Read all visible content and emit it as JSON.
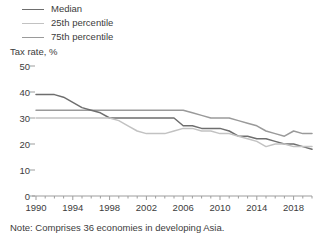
{
  "axis_title": "Tax rate, %",
  "note": "Note: Comprises 36 economies in developing Asia.",
  "legend": {
    "items": [
      {
        "label": "Median",
        "color": "#6e6e6e"
      },
      {
        "label": "25th percentile",
        "color": "#c2c2c2"
      },
      {
        "label": "75th percentile",
        "color": "#9a9a9a"
      }
    ]
  },
  "chart_data": {
    "type": "line",
    "title": "",
    "subtitle": "",
    "xlabel": "",
    "ylabel": "Tax rate, %",
    "xlim": [
      1990,
      2020
    ],
    "ylim": [
      0,
      50
    ],
    "yticks": [
      0,
      10,
      20,
      30,
      40,
      50
    ],
    "xticks": [
      1990,
      1994,
      1998,
      2002,
      2006,
      2010,
      2014,
      2018
    ],
    "grid": false,
    "legend_position": "top-left",
    "note": "Note: Comprises 36 economies in developing Asia.",
    "x": [
      1990,
      1991,
      1992,
      1993,
      1994,
      1995,
      1996,
      1997,
      1998,
      1999,
      2000,
      2001,
      2002,
      2003,
      2004,
      2005,
      2006,
      2007,
      2008,
      2009,
      2010,
      2011,
      2012,
      2013,
      2014,
      2015,
      2016,
      2017,
      2018,
      2019,
      2020
    ],
    "series": [
      {
        "name": "75th percentile",
        "color": "#9a9a9a",
        "values": [
          33,
          33,
          33,
          33,
          33,
          33,
          33,
          33,
          33,
          33,
          33,
          33,
          33,
          33,
          33,
          33,
          33,
          32,
          31,
          30,
          30,
          30,
          29,
          28,
          27,
          25,
          24,
          23,
          25,
          24,
          24
        ]
      },
      {
        "name": "Median",
        "color": "#6e6e6e",
        "values": [
          39,
          39,
          39,
          38,
          36,
          34,
          33,
          32,
          30,
          30,
          30,
          30,
          30,
          30,
          30,
          30,
          27,
          27,
          26,
          26,
          26,
          25,
          23,
          23,
          22,
          22,
          21,
          20,
          20,
          19,
          18
        ]
      },
      {
        "name": "25th percentile",
        "color": "#c2c2c2",
        "values": [
          30,
          30,
          30,
          30,
          30,
          30,
          30,
          30,
          30,
          29,
          27,
          25,
          24,
          24,
          24,
          25,
          26,
          26,
          25,
          25,
          24,
          24,
          23,
          22,
          21,
          19,
          20,
          20,
          19,
          19,
          19
        ]
      }
    ]
  }
}
